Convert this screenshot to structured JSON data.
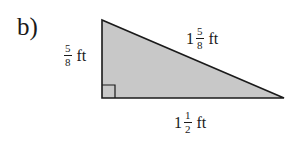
{
  "part_label": "b)",
  "figure": {
    "type": "right-triangle",
    "fill_color": "#c8c8c8",
    "stroke_color": "#1a1a1a",
    "right_angle_marker": "bottom-left",
    "vertical_leg": {
      "whole": "",
      "numerator": "5",
      "denominator": "8",
      "unit": "ft"
    },
    "hypotenuse": {
      "whole": "1",
      "numerator": "5",
      "denominator": "8",
      "unit": "ft"
    },
    "horizontal_leg": {
      "whole": "1",
      "numerator": "1",
      "denominator": "2",
      "unit": "ft"
    }
  }
}
